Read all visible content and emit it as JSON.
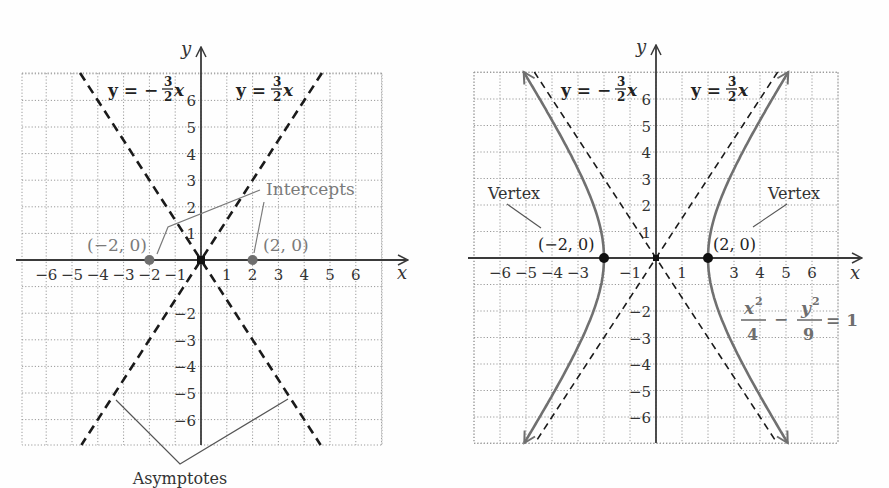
{
  "figure": {
    "left_panel": {
      "title": "Asymptotes and intercepts of hyperbola",
      "x_axis_label": "x",
      "y_axis_label": "y",
      "x_ticks": [
        "−6",
        "−5",
        "−4",
        "−3",
        "−2",
        "−1",
        "1",
        "2",
        "3",
        "4",
        "5",
        "6"
      ],
      "y_ticks": [
        "6",
        "5",
        "4",
        "3",
        "2",
        "1",
        "−2",
        "−3",
        "−4",
        "−5",
        "−6"
      ],
      "asymptote_neg_label": {
        "lhs": "y = −",
        "num": "3",
        "den": "2",
        "var": "x"
      },
      "asymptote_pos_label": {
        "lhs": "y = ",
        "num": "3",
        "den": "2",
        "var": "x"
      },
      "intercept_left_label": "(−2, 0)",
      "intercept_right_label": "(2, 0)",
      "intercepts_callout": "Intercepts",
      "asymptotes_callout": "Asymptotes"
    },
    "right_panel": {
      "x_axis_label": "x",
      "y_axis_label": "y",
      "x_ticks": [
        "−6",
        "−5",
        "−4",
        "−3",
        "−1",
        "1",
        "3",
        "4",
        "5",
        "6"
      ],
      "y_ticks": [
        "6",
        "5",
        "4",
        "3",
        "2",
        "1",
        "−2",
        "−3",
        "−4",
        "−5",
        "−6"
      ],
      "asymptote_neg_label": {
        "lhs": "y = −",
        "num": "3",
        "den": "2",
        "var": "x"
      },
      "asymptote_pos_label": {
        "lhs": "y = ",
        "num": "3",
        "den": "2",
        "var": "x"
      },
      "vertex_left_label": "(−2, 0)",
      "vertex_right_label": "(2, 0)",
      "vertex_callout_left": "Vertex",
      "vertex_callout_right": "Vertex",
      "equation": {
        "x_term": "x",
        "x_den": "4",
        "minus": "−",
        "y_term": "y",
        "y_den": "9",
        "exp": "2",
        "rhs": "= 1"
      }
    }
  },
  "colors": {
    "grid": "#9a9a9a",
    "axis": "#3a3a3a",
    "dashed": "#1a1a1a",
    "curve": "#707070",
    "callout_gray": "#7a7a7a",
    "vertex_dot": "#111111",
    "intercept_dot": "#6e6e6e"
  },
  "chart_data": [
    {
      "type": "line",
      "title": "Asymptotes y = ±(3/2)x with x-intercepts",
      "xlabel": "x",
      "ylabel": "y",
      "xlim": [
        -7,
        7
      ],
      "ylim": [
        -7,
        7
      ],
      "grid": true,
      "series": [
        {
          "name": "y = -3/2 x",
          "style": "dashed",
          "x": [
            -4.67,
            4.67
          ],
          "y": [
            7,
            -7
          ]
        },
        {
          "name": "y = 3/2 x",
          "style": "dashed",
          "x": [
            -4.67,
            4.67
          ],
          "y": [
            -7,
            7
          ]
        }
      ],
      "points": [
        {
          "label": "(-2, 0)",
          "x": -2,
          "y": 0
        },
        {
          "label": "(2, 0)",
          "x": 2,
          "y": 0
        }
      ],
      "annotations": [
        "Intercepts",
        "Asymptotes"
      ]
    },
    {
      "type": "line",
      "title": "Hyperbola x^2/4 - y^2/9 = 1",
      "xlabel": "x",
      "ylabel": "y",
      "xlim": [
        -7,
        7
      ],
      "ylim": [
        -7,
        7
      ],
      "grid": true,
      "series": [
        {
          "name": "y = -3/2 x",
          "style": "dashed",
          "x": [
            -4.67,
            4.67
          ],
          "y": [
            7,
            -7
          ]
        },
        {
          "name": "y = 3/2 x",
          "style": "dashed",
          "x": [
            -4.67,
            4.67
          ],
          "y": [
            -7,
            7
          ]
        },
        {
          "name": "right branch",
          "style": "solid",
          "x": [
            5.1,
            4.0,
            3.0,
            2.5,
            2.0,
            2.5,
            3.0,
            4.0,
            5.1
          ],
          "y": [
            7.0,
            5.2,
            3.35,
            2.25,
            0,
            -2.25,
            -3.35,
            -5.2,
            -7.0
          ]
        },
        {
          "name": "left branch",
          "style": "solid",
          "x": [
            -5.1,
            -4.0,
            -3.0,
            -2.5,
            -2.0,
            -2.5,
            -3.0,
            -4.0,
            -5.1
          ],
          "y": [
            7.0,
            5.2,
            3.35,
            2.25,
            0,
            -2.25,
            -3.35,
            -5.2,
            -7.0
          ]
        }
      ],
      "points": [
        {
          "label": "(-2, 0)",
          "x": -2,
          "y": 0
        },
        {
          "label": "(2, 0)",
          "x": 2,
          "y": 0
        }
      ],
      "annotations": [
        "Vertex",
        "Vertex",
        "x^2/4 - y^2/9 = 1"
      ]
    }
  ]
}
